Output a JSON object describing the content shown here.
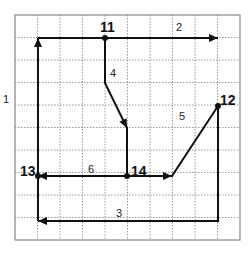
{
  "diagram": {
    "grid": {
      "x0": 15,
      "y0": 15,
      "cols": 10,
      "rows": 10,
      "step": 22.5,
      "border_color": "#888888",
      "grid_color": "#999999"
    },
    "nodes": [
      {
        "id": "11",
        "label": "11",
        "x": 105,
        "y": 38,
        "label_x": 100,
        "label_y": 20
      },
      {
        "id": "12",
        "label": "12",
        "x": 218,
        "y": 106,
        "label_x": 220,
        "label_y": 93
      },
      {
        "id": "13",
        "label": "13",
        "x": 38,
        "y": 176,
        "label_x": 20,
        "label_y": 164
      },
      {
        "id": "14",
        "label": "14",
        "x": 127,
        "y": 176,
        "label_x": 131,
        "label_y": 164
      }
    ],
    "edges": [
      {
        "id": "1",
        "label": "1",
        "label_x": 3,
        "label_y": 94,
        "points": [
          [
            38,
            221
          ],
          [
            38,
            38
          ]
        ],
        "arrow": true
      },
      {
        "id": "2",
        "label": "2",
        "label_x": 176,
        "label_y": 22,
        "points": [
          [
            38,
            38
          ],
          [
            218,
            38
          ]
        ],
        "arrow": true
      },
      {
        "id": "3",
        "label": "3",
        "label_x": 116,
        "label_y": 208,
        "points": [
          [
            218,
            106
          ],
          [
            218,
            221
          ],
          [
            38,
            221
          ]
        ],
        "arrow": true
      },
      {
        "id": "4",
        "label": "4",
        "label_x": 110,
        "label_y": 68,
        "points": [
          [
            105,
            38
          ],
          [
            105,
            83
          ],
          [
            127,
            128
          ],
          [
            127,
            176
          ]
        ],
        "arrow_at": [
          127,
          128
        ]
      },
      {
        "id": "5",
        "label": "5",
        "label_x": 179,
        "label_y": 111,
        "points": [
          [
            127,
            176
          ],
          [
            172,
            176
          ],
          [
            218,
            106
          ]
        ],
        "arrow_at": [
          172,
          176
        ]
      },
      {
        "id": "6",
        "label": "6",
        "label_x": 88,
        "label_y": 164,
        "points": [
          [
            127,
            176
          ],
          [
            38,
            176
          ]
        ],
        "arrow": true
      }
    ],
    "colors": {
      "line": "#111111",
      "text": "#222222"
    }
  }
}
